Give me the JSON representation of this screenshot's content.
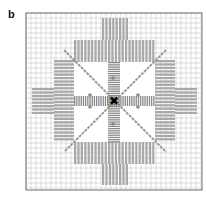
{
  "panel": {
    "label": "b"
  },
  "diagram": {
    "frame": {
      "x": 26,
      "y": 13,
      "w": 176,
      "h": 177
    },
    "grid_spacing": 5,
    "center": {
      "x": 114,
      "y": 101
    },
    "colors": {
      "grid": "#c8c8c8",
      "frame": "#6f6f6f",
      "bar": "#a9a9a9",
      "center_bar": "#8a8a8a",
      "diagonal": "#9a9a9a",
      "marker": "#000000"
    },
    "blocks": [
      {
        "name": "top-tall",
        "x": 102,
        "y": 18,
        "w": 25,
        "h": 22,
        "orient": "vertical"
      },
      {
        "name": "top-wide",
        "x": 74,
        "y": 40,
        "w": 81,
        "h": 22,
        "orient": "vertical"
      },
      {
        "name": "bottom-wide",
        "x": 74,
        "y": 142,
        "w": 81,
        "h": 22,
        "orient": "vertical"
      },
      {
        "name": "bottom-tall",
        "x": 102,
        "y": 164,
        "w": 25,
        "h": 21,
        "orient": "vertical"
      },
      {
        "name": "left-narrow",
        "x": 54,
        "y": 60,
        "w": 20,
        "h": 82,
        "orient": "horizontal"
      },
      {
        "name": "left-wide",
        "x": 32,
        "y": 88,
        "w": 22,
        "h": 27,
        "orient": "horizontal"
      },
      {
        "name": "right-narrow",
        "x": 155,
        "y": 60,
        "w": 20,
        "h": 82,
        "orient": "horizontal"
      },
      {
        "name": "right-wide",
        "x": 175,
        "y": 88,
        "w": 22,
        "h": 27,
        "orient": "horizontal"
      }
    ],
    "center_cross": {
      "vertical": {
        "x": 108,
        "y": 62,
        "w": 12,
        "h": 80
      },
      "horizontal": {
        "x": 74,
        "y": 96,
        "w": 81,
        "h": 10
      }
    },
    "marker_symbol": "✖"
  }
}
